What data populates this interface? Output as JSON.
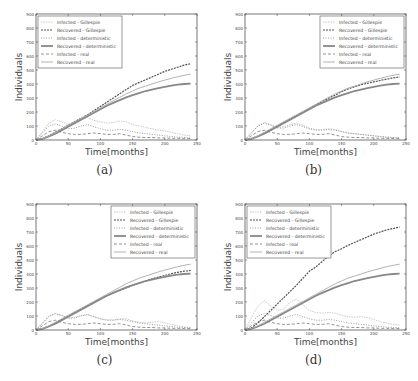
{
  "chart_data": [
    {
      "type": "line",
      "panel": "a",
      "caption": "(a)",
      "xlabel": "Time[months]",
      "ylabel": "Individuals",
      "xlim": [
        0,
        250
      ],
      "ylim": [
        0,
        900
      ],
      "xticks": [
        0,
        50,
        100,
        150,
        200,
        250
      ],
      "yticks": [
        0,
        100,
        200,
        300,
        400,
        500,
        600,
        700,
        800,
        900
      ],
      "legend_position": "upper left",
      "x": [
        0,
        10,
        20,
        30,
        40,
        50,
        60,
        70,
        80,
        90,
        100,
        110,
        120,
        130,
        140,
        150,
        160,
        170,
        180,
        190,
        200,
        210,
        220,
        230,
        240
      ],
      "series": [
        {
          "name": "Infected - Gillespie",
          "style": "dotted-thin",
          "values": [
            0,
            60,
            120,
            145,
            130,
            110,
            130,
            150,
            160,
            140,
            130,
            120,
            125,
            135,
            130,
            110,
            100,
            90,
            80,
            70,
            65,
            55,
            45,
            35,
            30
          ]
        },
        {
          "name": "Recovered - Gillespie",
          "style": "plus-markers",
          "values": [
            0,
            10,
            30,
            55,
            80,
            105,
            130,
            155,
            180,
            210,
            240,
            270,
            300,
            330,
            360,
            390,
            410,
            430,
            450,
            470,
            490,
            505,
            520,
            535,
            545
          ]
        },
        {
          "name": "Infected - deterministic",
          "style": "dot-markers",
          "values": [
            0,
            50,
            100,
            115,
            100,
            80,
            85,
            100,
            110,
            95,
            80,
            70,
            70,
            75,
            70,
            60,
            50,
            45,
            40,
            35,
            30,
            25,
            20,
            18,
            15
          ]
        },
        {
          "name": "Recovered - deterministic",
          "style": "circle-markers",
          "values": [
            0,
            8,
            25,
            45,
            70,
            95,
            120,
            145,
            170,
            195,
            220,
            245,
            265,
            285,
            305,
            320,
            335,
            350,
            360,
            370,
            380,
            388,
            395,
            400,
            402
          ]
        },
        {
          "name": "Infected - real",
          "style": "dashed",
          "values": [
            0,
            30,
            60,
            70,
            55,
            45,
            40,
            40,
            45,
            50,
            45,
            40,
            40,
            45,
            35,
            25,
            20,
            18,
            18,
            15,
            15,
            12,
            12,
            10,
            10
          ]
        },
        {
          "name": "Recovered - real",
          "style": "solid",
          "values": [
            0,
            10,
            30,
            55,
            80,
            105,
            130,
            155,
            180,
            205,
            230,
            255,
            280,
            305,
            330,
            350,
            370,
            385,
            400,
            415,
            428,
            440,
            452,
            462,
            470
          ]
        }
      ]
    },
    {
      "type": "line",
      "panel": "b",
      "caption": "(b)",
      "xlabel": "Time[months]",
      "ylabel": "Individuals",
      "xlim": [
        0,
        250
      ],
      "ylim": [
        0,
        900
      ],
      "xticks": [
        0,
        50,
        100,
        150,
        200,
        250
      ],
      "yticks": [
        0,
        100,
        200,
        300,
        400,
        500,
        600,
        700,
        800,
        900
      ],
      "legend_position": "upper right",
      "x": [
        0,
        10,
        20,
        30,
        40,
        50,
        60,
        70,
        80,
        90,
        100,
        110,
        120,
        130,
        140,
        150,
        160,
        170,
        180,
        190,
        200,
        210,
        220,
        230,
        240
      ],
      "series": [
        {
          "name": "Infected - Gillespie",
          "style": "dotted-thin",
          "values": [
            0,
            50,
            100,
            125,
            110,
            90,
            95,
            110,
            120,
            105,
            85,
            75,
            75,
            80,
            75,
            60,
            50,
            45,
            40,
            35,
            30,
            25,
            20,
            18,
            15
          ]
        },
        {
          "name": "Recovered - Gillespie",
          "style": "plus-markers",
          "values": [
            0,
            10,
            28,
            50,
            75,
            100,
            125,
            150,
            175,
            200,
            225,
            250,
            275,
            300,
            320,
            345,
            365,
            380,
            395,
            405,
            415,
            425,
            435,
            443,
            450
          ]
        },
        {
          "name": "Infected - deterministic",
          "style": "dot-markers",
          "values": [
            0,
            50,
            100,
            120,
            105,
            85,
            85,
            100,
            110,
            95,
            80,
            70,
            70,
            75,
            70,
            60,
            50,
            45,
            40,
            35,
            30,
            25,
            20,
            18,
            15
          ]
        },
        {
          "name": "Recovered - deterministic",
          "style": "circle-markers",
          "values": [
            0,
            8,
            25,
            45,
            70,
            95,
            120,
            145,
            170,
            195,
            220,
            245,
            265,
            285,
            305,
            320,
            335,
            350,
            360,
            370,
            380,
            388,
            395,
            400,
            402
          ]
        },
        {
          "name": "Infected - real",
          "style": "dashed",
          "values": [
            0,
            30,
            60,
            70,
            55,
            45,
            40,
            40,
            45,
            50,
            45,
            40,
            40,
            45,
            35,
            25,
            20,
            18,
            18,
            15,
            15,
            12,
            12,
            10,
            10
          ]
        },
        {
          "name": "Recovered - real",
          "style": "solid",
          "values": [
            0,
            10,
            30,
            55,
            80,
            105,
            130,
            155,
            180,
            205,
            230,
            255,
            280,
            305,
            330,
            350,
            370,
            385,
            400,
            415,
            428,
            440,
            452,
            462,
            470
          ]
        }
      ]
    },
    {
      "type": "line",
      "panel": "c",
      "caption": "(c)",
      "xlabel": "Time[months]",
      "ylabel": "Individuals",
      "xlim": [
        0,
        250
      ],
      "ylim": [
        0,
        900
      ],
      "xticks": [
        0,
        50,
        100,
        150,
        200,
        250
      ],
      "yticks": [
        0,
        100,
        200,
        300,
        400,
        500,
        600,
        700,
        800,
        900
      ],
      "legend_position": "upper right",
      "x": [
        0,
        10,
        20,
        30,
        40,
        50,
        60,
        70,
        80,
        90,
        100,
        110,
        120,
        130,
        140,
        150,
        160,
        170,
        180,
        190,
        200,
        210,
        220,
        230,
        240
      ],
      "series": [
        {
          "name": "Infected - Gillespie",
          "style": "dotted-thin",
          "values": [
            0,
            45,
            95,
            115,
            105,
            85,
            90,
            105,
            110,
            95,
            80,
            72,
            72,
            80,
            80,
            65,
            55,
            50,
            55,
            60,
            50,
            40,
            30,
            22,
            18
          ]
        },
        {
          "name": "Recovered - Gillespie",
          "style": "plus-markers",
          "values": [
            0,
            10,
            28,
            50,
            75,
            100,
            125,
            150,
            175,
            200,
            225,
            245,
            265,
            285,
            300,
            320,
            335,
            350,
            365,
            378,
            390,
            402,
            412,
            420,
            425
          ]
        },
        {
          "name": "Infected - deterministic",
          "style": "dot-markers",
          "values": [
            0,
            50,
            100,
            118,
            103,
            85,
            85,
            100,
            110,
            95,
            80,
            70,
            70,
            75,
            70,
            60,
            50,
            45,
            40,
            35,
            30,
            25,
            20,
            18,
            15
          ]
        },
        {
          "name": "Recovered - deterministic",
          "style": "circle-markers",
          "values": [
            0,
            8,
            25,
            45,
            70,
            95,
            120,
            145,
            170,
            195,
            220,
            245,
            265,
            285,
            305,
            320,
            335,
            350,
            360,
            370,
            380,
            388,
            395,
            400,
            402
          ]
        },
        {
          "name": "Infected - real",
          "style": "dashed",
          "values": [
            0,
            30,
            60,
            70,
            55,
            45,
            40,
            40,
            45,
            50,
            45,
            40,
            40,
            45,
            35,
            25,
            20,
            18,
            18,
            15,
            15,
            12,
            12,
            10,
            10
          ]
        },
        {
          "name": "Recovered - real",
          "style": "solid",
          "values": [
            0,
            10,
            30,
            55,
            80,
            105,
            130,
            155,
            180,
            205,
            230,
            255,
            280,
            305,
            330,
            350,
            370,
            385,
            400,
            415,
            428,
            440,
            452,
            462,
            470
          ]
        }
      ]
    },
    {
      "type": "line",
      "panel": "d",
      "caption": "(d)",
      "xlabel": "Time[months]",
      "ylabel": "Individuals",
      "xlim": [
        0,
        250
      ],
      "ylim": [
        0,
        900
      ],
      "xticks": [
        0,
        50,
        100,
        150,
        200,
        250
      ],
      "yticks": [
        0,
        100,
        200,
        300,
        400,
        500,
        600,
        700,
        800,
        900
      ],
      "legend_position": "upper left",
      "x": [
        0,
        10,
        20,
        30,
        40,
        50,
        60,
        70,
        80,
        90,
        100,
        110,
        120,
        130,
        140,
        150,
        160,
        170,
        180,
        190,
        200,
        210,
        220,
        230,
        240
      ],
      "series": [
        {
          "name": "Infected - Gillespie",
          "style": "dotted-thin",
          "values": [
            0,
            90,
            170,
            210,
            170,
            140,
            150,
            200,
            220,
            180,
            140,
            125,
            120,
            125,
            120,
            105,
            95,
            90,
            95,
            90,
            75,
            60,
            50,
            40,
            35
          ]
        },
        {
          "name": "Recovered - Gillespie",
          "style": "plus-markers",
          "values": [
            0,
            15,
            50,
            95,
            140,
            185,
            230,
            275,
            320,
            370,
            420,
            450,
            490,
            530,
            560,
            580,
            605,
            625,
            645,
            665,
            685,
            700,
            715,
            725,
            735
          ]
        },
        {
          "name": "Infected - deterministic",
          "style": "dot-markers",
          "values": [
            0,
            50,
            100,
            118,
            103,
            85,
            85,
            100,
            110,
            95,
            80,
            70,
            70,
            75,
            70,
            60,
            50,
            45,
            40,
            35,
            30,
            25,
            20,
            18,
            15
          ]
        },
        {
          "name": "Recovered - deterministic",
          "style": "circle-markers",
          "values": [
            0,
            8,
            25,
            45,
            70,
            95,
            120,
            145,
            170,
            195,
            220,
            245,
            265,
            285,
            305,
            320,
            335,
            350,
            360,
            370,
            380,
            388,
            395,
            400,
            402
          ]
        },
        {
          "name": "Infected - real",
          "style": "dashed",
          "values": [
            0,
            30,
            60,
            70,
            55,
            45,
            40,
            40,
            45,
            50,
            45,
            40,
            40,
            45,
            35,
            25,
            20,
            18,
            18,
            15,
            15,
            12,
            12,
            10,
            10
          ]
        },
        {
          "name": "Recovered - real",
          "style": "solid",
          "values": [
            0,
            10,
            30,
            55,
            80,
            105,
            130,
            155,
            180,
            205,
            230,
            255,
            280,
            305,
            330,
            350,
            370,
            385,
            400,
            415,
            428,
            440,
            452,
            462,
            470
          ]
        }
      ]
    }
  ],
  "figure": {
    "colors": {
      "axis": "#555555",
      "text": "#444444",
      "series": [
        "#bbbbbb",
        "#555555",
        "#999999",
        "#888888",
        "#777777",
        "#aaaaaa"
      ]
    }
  }
}
